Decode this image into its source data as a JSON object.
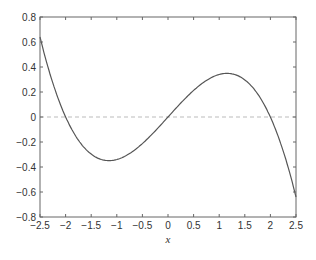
{
  "chart_data": {
    "type": "line",
    "title": "",
    "xlabel": "x",
    "ylabel": "",
    "xlim": [
      -2.5,
      2.5
    ],
    "ylim": [
      -0.8,
      0.8
    ],
    "x_ticks": [
      -2.5,
      -2,
      -1.5,
      -1,
      -0.5,
      0,
      0.5,
      1,
      1.5,
      2,
      2.5
    ],
    "x_tick_labels": [
      "-2.5",
      "-2",
      "-1.5",
      "-1",
      "-0.5",
      "0",
      "0.5",
      "1",
      "1.5",
      "2",
      "2.5"
    ],
    "y_ticks": [
      0.8,
      0.6,
      0.4,
      0.2,
      0,
      -0.2,
      -0.4,
      -0.6,
      -0.8
    ],
    "y_tick_labels": [
      "0.8",
      "0.6",
      "0.4",
      "0.2",
      "0",
      "-0.2",
      "-0.4",
      "-0.6",
      "-0.8"
    ],
    "grid": false,
    "legend": null,
    "series": [
      {
        "name": "curve",
        "style": "solid",
        "color": "#555555",
        "x": [
          -2.5,
          -2.25,
          -2.0,
          -1.75,
          -1.5,
          -1.25,
          -1.0,
          -0.75,
          -0.5,
          -0.25,
          0.0,
          0.25,
          0.5,
          0.75,
          1.0,
          1.25,
          1.5,
          1.75,
          2.0,
          2.25,
          2.5
        ],
        "y": [
          0.64,
          0.27,
          0.0,
          -0.19,
          -0.3,
          -0.35,
          -0.34,
          -0.29,
          -0.21,
          -0.11,
          0.0,
          0.11,
          0.21,
          0.29,
          0.34,
          0.35,
          0.3,
          0.19,
          0.0,
          -0.27,
          -0.64
        ]
      },
      {
        "name": "zero-line",
        "style": "dashed",
        "color": "#bbbbbb",
        "x": [
          -2.5,
          2.5
        ],
        "y": [
          0,
          0
        ]
      }
    ]
  }
}
